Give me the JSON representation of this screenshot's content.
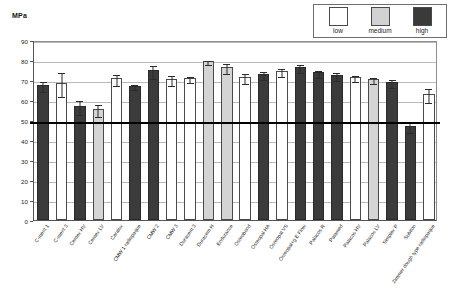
{
  "axis_title": "MPa",
  "legend": {
    "items": [
      {
        "label": "low",
        "swatch": "low-swatch",
        "color": "#ffffff"
      },
      {
        "label": "medium",
        "swatch": "medium-swatch",
        "color": "#d2d2d2"
      },
      {
        "label": "high",
        "swatch": "high-swatch",
        "color": "#3a3a3a"
      }
    ]
  },
  "chart_data": {
    "type": "bar",
    "title": "",
    "xlabel": "",
    "ylabel": "MPa",
    "ylim": [
      0,
      90
    ],
    "yticks": [
      0,
      10,
      20,
      30,
      40,
      50,
      60,
      70,
      80,
      90
    ],
    "grid": true,
    "legend_position": "top-right",
    "reference_line": {
      "value": 50,
      "style": "bold-black"
    },
    "series_groups": [
      "low",
      "medium",
      "high"
    ],
    "categories": [
      "C-ment 1",
      "C-ment 3",
      "Cemex HV",
      "Cemex LV",
      "Ceralux",
      "CMW 1 radiopaque",
      "CMW 2",
      "CMW 3",
      "Duracem 3",
      "Duracem H",
      "Endurance",
      "Osteobond",
      "Osteopal HA",
      "Osteopal VS",
      "Osteopal+g E Flow",
      "Palacos R",
      "Palamed",
      "Palacos HV",
      "Palacos LV",
      "Simplex P",
      "Subiton",
      "Zimmer dough type radiopaque"
    ],
    "values": [
      67.5,
      68.5,
      57.0,
      55.5,
      70.8,
      67.2,
      74.8,
      70.7,
      71.0,
      79.5,
      76.5,
      71.5,
      73.0,
      74.5,
      76.5,
      73.8,
      72.5,
      71.5,
      70.5,
      69.0,
      47.0,
      63.0
    ],
    "errors": [
      2.3,
      5.8,
      3.3,
      3.0,
      2.6,
      1.2,
      3.3,
      2.5,
      1.7,
      0.9,
      2.6,
      2.3,
      2.0,
      2.0,
      2.0,
      1.8,
      1.8,
      1.3,
      1.6,
      1.8,
      2.3,
      3.4
    ],
    "viscosity": [
      "high",
      "low",
      "high",
      "medium",
      "low",
      "high",
      "high",
      "low",
      "low",
      "medium",
      "medium",
      "low",
      "high",
      "low",
      "high",
      "high",
      "high",
      "low",
      "medium",
      "high",
      "high",
      "low"
    ]
  }
}
